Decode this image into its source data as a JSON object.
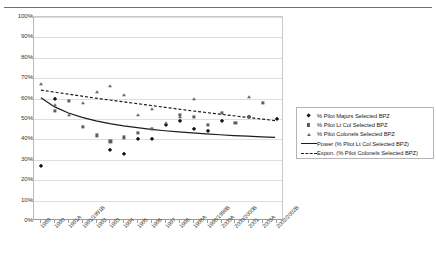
{
  "chart_data": {
    "type": "scatter",
    "title": "",
    "xlabel": "",
    "ylabel": "",
    "ylim": [
      0,
      1
    ],
    "ytick_labels": [
      "0%",
      "10%",
      "20%",
      "30%",
      "40%",
      "50%",
      "60%",
      "70%",
      "80%",
      "90%",
      "100%"
    ],
    "ytick_values": [
      0,
      10,
      20,
      30,
      40,
      50,
      60,
      70,
      80,
      90,
      100
    ],
    "grid": true,
    "legend_position": "right",
    "categories": [
      "1989",
      "1990",
      "1991A",
      "1991/1991B",
      "1992",
      "1993",
      "1994",
      "1995",
      "1996",
      "1997",
      "1998",
      "1998A",
      "1998/1998B",
      "2000A",
      "2000/2000B",
      "2001",
      "2002A",
      "2002/2002B"
    ],
    "series": [
      {
        "name": "% Pilot Majors Selected BPZ",
        "marker": "diamond",
        "color": "#141414",
        "values": [
          27,
          60,
          null,
          null,
          null,
          35,
          33,
          40,
          40,
          47,
          49,
          45,
          44,
          49,
          null,
          51,
          null,
          50
        ]
      },
      {
        "name": "% Pilot Lt Col Selected BPZ",
        "marker": "square",
        "color": "#5d5d5d",
        "values": [
          null,
          54,
          59,
          46,
          42,
          39,
          41,
          43,
          45,
          null,
          52,
          51,
          47,
          53,
          48,
          51,
          58,
          null
        ]
      },
      {
        "name": "% Pilot Colonels Selected BPZ",
        "marker": "triangle",
        "color": "#6a6a6a",
        "values": [
          67,
          57,
          52,
          58,
          63,
          66,
          62,
          52,
          55,
          48,
          51,
          60,
          null,
          null,
          null,
          61,
          null,
          null
        ]
      }
    ],
    "trendlines": [
      {
        "name": "Power (% Pilot Lt Col Selected BPZ)",
        "style": "solid",
        "color": "#1c1c1c",
        "source_series": "% Pilot Lt Col Selected BPZ",
        "points": [
          [
            0,
            60
          ],
          [
            1,
            55.5
          ],
          [
            2,
            52.5
          ],
          [
            3,
            50.3
          ],
          [
            4,
            48.6
          ],
          [
            5,
            47.2
          ],
          [
            6,
            46.1
          ],
          [
            7,
            45.2
          ],
          [
            8,
            44.4
          ],
          [
            9,
            43.7
          ],
          [
            10,
            43.1
          ],
          [
            11,
            42.6
          ],
          [
            12,
            42.1
          ],
          [
            13,
            41.7
          ],
          [
            14,
            41.3
          ],
          [
            15,
            41.0
          ],
          [
            16,
            40.7
          ],
          [
            17,
            40.4
          ]
        ]
      },
      {
        "name": "Expon. (% Pilot Colonels Selected BPZ)",
        "style": "dashed",
        "color": "#1c1c1c",
        "source_series": "% Pilot Colonels Selected BPZ",
        "points": [
          [
            0,
            63.8
          ],
          [
            1,
            62.8
          ],
          [
            2,
            61.8
          ],
          [
            3,
            60.8
          ],
          [
            4,
            59.8
          ],
          [
            5,
            58.9
          ],
          [
            6,
            58.0
          ],
          [
            7,
            57.1
          ],
          [
            8,
            56.2
          ],
          [
            9,
            55.3
          ],
          [
            10,
            54.4
          ],
          [
            11,
            53.5
          ],
          [
            12,
            52.7
          ],
          [
            13,
            51.9
          ],
          [
            14,
            51.1
          ],
          [
            15,
            50.3
          ],
          [
            16,
            49.5
          ],
          [
            17,
            48.7
          ]
        ]
      }
    ]
  },
  "legend": {
    "entries": [
      {
        "label": "% Pilot Majors Selected BPZ",
        "key": "diamond"
      },
      {
        "label": "% Pilot Lt Col Selected BPZ",
        "key": "square"
      },
      {
        "label": "% Pilot Colonels Selected BPZ",
        "key": "triangle"
      },
      {
        "label": "Power (% Pilot Lt Col Selected BPZ)",
        "key": "solid-line"
      },
      {
        "label": "Expon. (% Pilot Colonels Selected BPZ)",
        "key": "dashed-line"
      }
    ]
  }
}
